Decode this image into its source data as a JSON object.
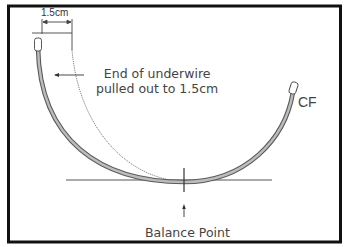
{
  "diagram": {
    "labels": {
      "dimension": "1.5cm",
      "end_line1": "End of underwire",
      "end_line2": "pulled out to 1.5cm",
      "cf": "CF",
      "balance": "Balance Point"
    },
    "colors": {
      "frame": "#111111",
      "wire_outer": "#5a5a5a",
      "wire_fill": "#b8b8b8",
      "text": "#444444",
      "lines": "#555555"
    }
  }
}
